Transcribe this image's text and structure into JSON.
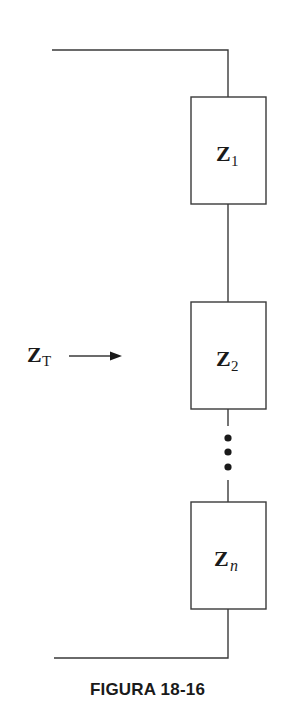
{
  "diagram": {
    "type": "series impedance circuit",
    "input_label": {
      "main": "Z",
      "sub": "T"
    },
    "impedances": [
      {
        "main": "Z",
        "sub": "1"
      },
      {
        "main": "Z",
        "sub": "2"
      },
      {
        "main": "Z",
        "sub": "n"
      }
    ],
    "continuation": "vertical ellipsis (three dots) between Z2 and Zn",
    "arrow_direction": "right"
  },
  "caption": "FIGURA 18-16"
}
